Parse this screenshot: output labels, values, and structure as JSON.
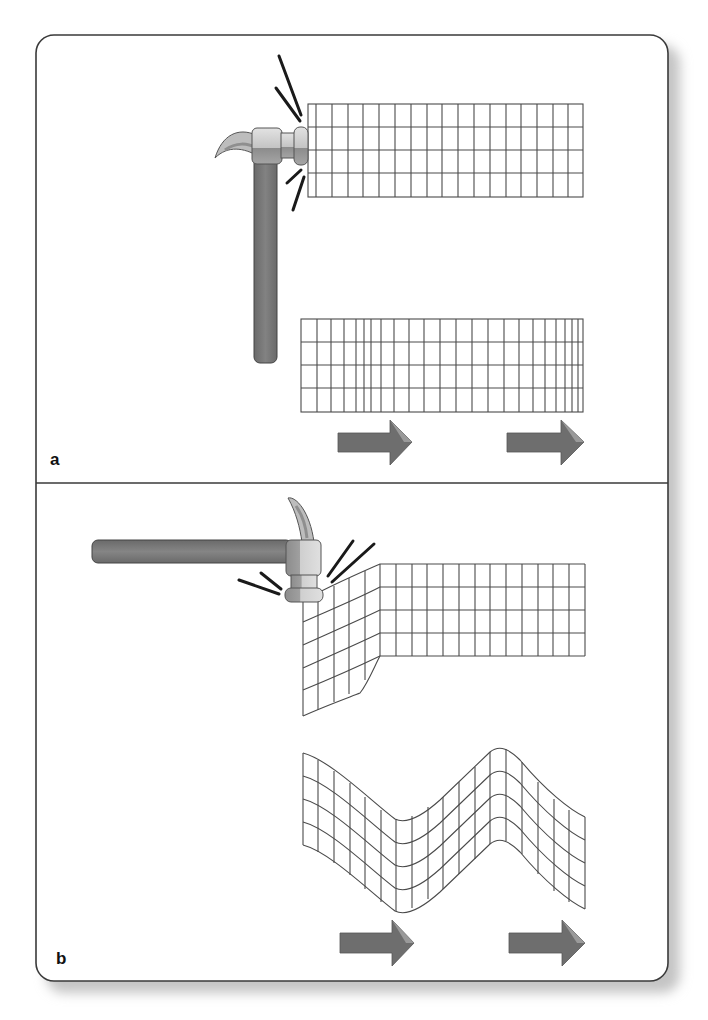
{
  "figure": {
    "colors": {
      "frame": "#3a3a3a",
      "grid_line": "#4a4a4a",
      "handle": "#7a7a7a",
      "head": "#c9c9c9",
      "head_dark": "#8f8f8f",
      "arrow": "#6e6e6e",
      "impact_line": "#1a1a1a",
      "shadow": "#bdbdbd"
    },
    "panels": [
      {
        "label": "a",
        "type": "longitudinal",
        "grid_initial": {
          "rows": 4,
          "cols": 18,
          "state": "undisturbed, hammer striking end"
        },
        "grid_after": {
          "rows": 4,
          "cols": 24,
          "state": "compressions and rarefactions along length"
        },
        "arrows": 2,
        "arrow_direction": "right"
      },
      {
        "label": "b",
        "type": "transverse",
        "grid_initial": {
          "rows": 4,
          "cols": 18,
          "state": "end deflected downward by hammer from above"
        },
        "grid_after": {
          "rows": 4,
          "cols": 18,
          "state": "sinusoidal displacement perpendicular to travel"
        },
        "arrows": 2,
        "arrow_direction": "right"
      }
    ]
  }
}
